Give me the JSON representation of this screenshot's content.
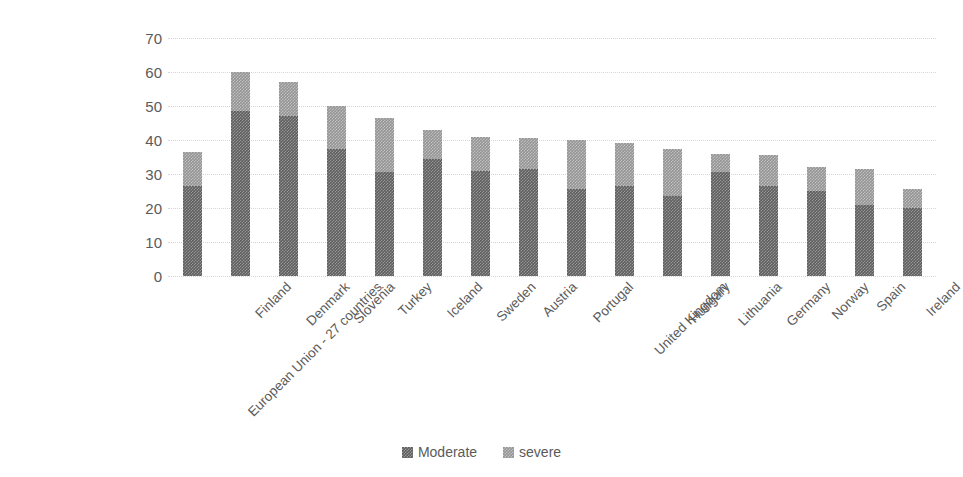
{
  "chart_data": {
    "type": "bar",
    "subtype": "stacked-bar",
    "title": "",
    "subtitle": "",
    "xlabel": "",
    "ylabel": "",
    "ylim": [
      0,
      70
    ],
    "ytick_step": 10,
    "yticks": [
      "0",
      "10",
      "20",
      "30",
      "40",
      "50",
      "60",
      "70"
    ],
    "grid": true,
    "grid_axis": "y",
    "grid_style": "dotted",
    "legend_position": "bottom-center",
    "categories": [
      "European Union - 27 countries",
      "Finland",
      "Denmark",
      "Slovenia",
      "Turkey",
      "Iceland",
      "Sweden",
      "Austria",
      "Portugal",
      "United Kingdom",
      "Hungary",
      "Lithuania",
      "Germany",
      "Norway",
      "Spain",
      "Ireland"
    ],
    "series": [
      {
        "name": "Moderate",
        "color": "#5e5e5e",
        "values": [
          26.5,
          48.5,
          47.0,
          37.5,
          30.5,
          34.5,
          31.0,
          31.5,
          25.5,
          26.5,
          23.5,
          30.5,
          26.5,
          25.0,
          21.0,
          20.0
        ]
      },
      {
        "name": "severe",
        "color": "#959595",
        "values": [
          10.0,
          11.5,
          10.0,
          12.5,
          16.0,
          8.5,
          10.0,
          9.0,
          14.5,
          12.5,
          14.0,
          5.5,
          9.0,
          7.0,
          10.5,
          5.5
        ]
      }
    ],
    "totals": [
      36.5,
      60.0,
      57.0,
      50.0,
      46.5,
      43.0,
      41.0,
      40.5,
      40.0,
      39.0,
      37.5,
      36.0,
      35.5,
      32.0,
      31.5,
      25.5
    ]
  },
  "legend": {
    "items": [
      {
        "label": "Moderate",
        "swatch": "legend-swatch-moderate"
      },
      {
        "label": "severe",
        "swatch": "legend-swatch-severe"
      }
    ]
  },
  "colors": {
    "background": "#ffffff",
    "text": "#5a5a5a",
    "gridline": "#d6d6d6",
    "moderate": "#5e5e5e",
    "severe": "#959595"
  }
}
